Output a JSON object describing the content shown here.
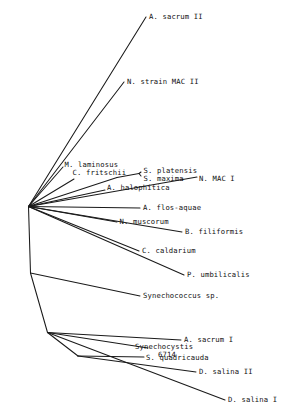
{
  "figure": {
    "kind": "phylogenetic-tree",
    "style": "unrooted-radial-cladogram",
    "background_color": "#ffffff",
    "line_color": "#1a1a1a",
    "text_color": "#111111"
  },
  "chart_data": {
    "type": "diagram",
    "title": "",
    "xlabel": "",
    "ylabel": "",
    "grid": false,
    "legend": false,
    "leaf_count": 17,
    "taxa": [
      "A. sacrum II",
      "N. strain MAC II",
      "M. laminosus",
      "C. fritschii",
      "S. platensis",
      "S. maxima",
      "N. MAC I",
      "A. halophitica",
      "A. flos-aquae",
      "N. muscorum",
      "B. filiformis",
      "C. caldarium",
      "P. umbilicalis",
      "Synechococcus sp.",
      "A. sacrum I",
      "Synechocystis 6714",
      "S. quadricauda",
      "D. salina II",
      "D. salina I"
    ]
  },
  "tree": {
    "nodes": [
      {
        "name": "root-node",
        "x": 28.5,
        "y": 206.5
      },
      {
        "name": "internal-node-lower",
        "x": 30.5,
        "y": 273.0
      },
      {
        "name": "internal-node-bottom-cluster",
        "x": 47.5,
        "y": 332.5
      },
      {
        "name": "internal-node-salina",
        "x": 78.0,
        "y": 356.0
      },
      {
        "name": "internal-node-spirulina",
        "x": 117.0,
        "y": 177.5
      },
      {
        "name": "internal-node-platensis-maxima",
        "x": 139.0,
        "y": 173.5
      }
    ],
    "leaves": [
      {
        "id": "a-sacrum-ii",
        "label": "A. sacrum II",
        "tip_x": 146.0,
        "tip_y": 17.0,
        "from": "root-node",
        "label_x": 149.0,
        "label_y": 13.0
      },
      {
        "id": "n-strain-mac-ii",
        "label": "N. strain MAC II",
        "tip_x": 124.0,
        "tip_y": 82.0,
        "from": "root-node",
        "label_x": 127.0,
        "label_y": 78.0
      },
      {
        "id": "m-laminosus",
        "label": "M. laminosus",
        "tip_x": 63.0,
        "tip_y": 167.0,
        "from": "root-node",
        "label_x": 64.5,
        "label_y": 160.5
      },
      {
        "id": "c-fritschii",
        "label": "C. fritschii",
        "tip_x": 74.0,
        "tip_y": 179.0,
        "from": "root-node",
        "label_x": 72.5,
        "label_y": 169.0
      },
      {
        "id": "s-platensis",
        "label": "S. platensis",
        "tip_x": 141.0,
        "tip_y": 172.0,
        "from": "internal-node-platensis-maxima",
        "label_x": 143.5,
        "label_y": 166.5
      },
      {
        "id": "s-maxima",
        "label": "S. maxima",
        "tip_x": 141.0,
        "tip_y": 176.0,
        "from": "internal-node-platensis-maxima",
        "label_x": 143.5,
        "label_y": 175.0
      },
      {
        "id": "n-mac-i",
        "label": "N. MAC I",
        "tip_x": 197.0,
        "tip_y": 177.0,
        "from": "root-node",
        "label_x": 199.0,
        "label_y": 175.0
      },
      {
        "id": "a-halophitica",
        "label": "A. halophitica",
        "tip_x": 105.0,
        "tip_y": 190.0,
        "from": "root-node",
        "label_x": 107.0,
        "label_y": 183.5
      },
      {
        "id": "a-flos-aquae",
        "label": "A. flos-aquae",
        "tip_x": 140.0,
        "tip_y": 208.0,
        "from": "root-node",
        "label_x": 143.0,
        "label_y": 203.5
      },
      {
        "id": "n-muscorum",
        "label": "N. muscorum",
        "tip_x": 117.0,
        "tip_y": 222.0,
        "from": "root-node",
        "label_x": 119.5,
        "label_y": 217.5
      },
      {
        "id": "b-filiformis",
        "label": "B. filiformis",
        "tip_x": 182.0,
        "tip_y": 232.0,
        "from": "root-node",
        "label_x": 185.0,
        "label_y": 227.5
      },
      {
        "id": "c-caldarium",
        "label": "C. caldarium",
        "tip_x": 139.0,
        "tip_y": 251.0,
        "from": "root-node",
        "label_x": 142.0,
        "label_y": 246.5
      },
      {
        "id": "p-umbilicalis",
        "label": "P. umbilicalis",
        "tip_x": 184.0,
        "tip_y": 275.0,
        "from": "root-node",
        "label_x": 187.0,
        "label_y": 270.5
      },
      {
        "id": "synechococcus-sp",
        "label": "Synechococcus sp.",
        "tip_x": 140.0,
        "tip_y": 296.0,
        "from": "internal-node-lower",
        "label_x": 143.0,
        "label_y": 291.5
      },
      {
        "id": "a-sacrum-i",
        "label": "A. sacrum I",
        "tip_x": 181.0,
        "tip_y": 340.0,
        "from": "internal-node-bottom-cluster",
        "label_x": 184.0,
        "label_y": 335.5
      },
      {
        "id": "synechocystis-6714",
        "label": "Synechocystis",
        "label2": "6714",
        "tip_x": 148.0,
        "tip_y": 348.0,
        "from": "internal-node-bottom-cluster",
        "label_x": 135.0,
        "label_y": 343.0,
        "label2_x": 158.0,
        "label2_y": 351.0
      },
      {
        "id": "s-quadricauda",
        "label": "S. quadricauda",
        "tip_x": 144.0,
        "tip_y": 357.0,
        "from": "internal-node-salina",
        "label_x": 146.0,
        "label_y": 353.5
      },
      {
        "id": "d-salina-ii",
        "label": "D. salina II",
        "tip_x": 196.0,
        "tip_y": 372.0,
        "from": "internal-node-salina",
        "label_x": 199.0,
        "label_y": 367.5
      },
      {
        "id": "d-salina-i",
        "label": "D. salina I",
        "tip_x": 225.0,
        "tip_y": 400.0,
        "from": "internal-node-bottom-cluster",
        "label_x": 228.0,
        "label_y": 395.5
      }
    ],
    "internal_edges": [
      {
        "id": "root-to-lower",
        "from": "root-node",
        "to": "internal-node-lower"
      },
      {
        "id": "lower-to-bottom-cluster",
        "from": "internal-node-lower",
        "to": "internal-node-bottom-cluster"
      },
      {
        "id": "bottom-cluster-to-salina",
        "from": "internal-node-bottom-cluster",
        "to": "internal-node-salina"
      },
      {
        "id": "root-to-spirulina",
        "from": "root-node",
        "to": "internal-node-spirulina"
      },
      {
        "id": "spirulina-to-platensis-maxima",
        "from": "internal-node-spirulina",
        "to": "internal-node-platensis-maxima"
      }
    ]
  }
}
